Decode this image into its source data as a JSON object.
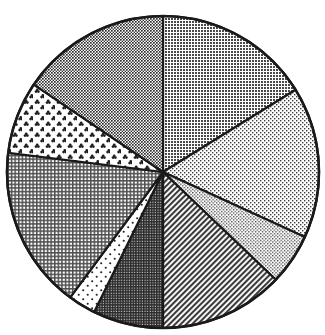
{
  "chart_data": {
    "type": "pie",
    "title": "",
    "subtitle": "",
    "xlabel": "",
    "ylabel": "",
    "legend_position": "none",
    "grid": false,
    "start_angle_deg": 0,
    "direction": "clockwise",
    "center_px": [
      163,
      172
    ],
    "radius_px": 156,
    "categories": [
      "Slice 1",
      "Slice 2",
      "Slice 3",
      "Slice 4",
      "Slice 5",
      "Slice 6",
      "Slice 7",
      "Slice 8",
      "Slice 9"
    ],
    "values": [
      58.2,
      56.4,
      19.1,
      46.3,
      26.2,
      10.3,
      60.6,
      27.0,
      55.9
    ],
    "percentages": [
      16.2,
      15.7,
      5.3,
      12.9,
      7.3,
      2.9,
      16.8,
      7.5,
      15.5
    ],
    "angles_deg": [
      58.2,
      56.4,
      19.1,
      46.3,
      26.2,
      10.3,
      60.6,
      27.0,
      55.9
    ],
    "boundaries_deg": [
      0,
      58.2,
      114.6,
      133.7,
      180.0,
      206.2,
      216.5,
      277.1,
      304.1,
      360
    ],
    "slices": [
      {
        "label": "Slice 1",
        "value": 58.2,
        "percent": 16.2,
        "start_deg": 0,
        "end_deg": 58.2,
        "pattern": "dense-dot-medium-gray",
        "fill_color": "#7d7d7d"
      },
      {
        "label": "Slice 2",
        "value": 56.4,
        "percent": 15.7,
        "start_deg": 58.2,
        "end_deg": 114.6,
        "pattern": "sparse-dot-light-gray",
        "fill_color": "#d2d2d2"
      },
      {
        "label": "Slice 3",
        "value": 19.1,
        "percent": 5.3,
        "start_deg": 114.6,
        "end_deg": 133.7,
        "pattern": "fine-dot-light-gray",
        "fill_color": "#c9c9c9"
      },
      {
        "label": "Slice 4",
        "value": 46.3,
        "percent": 12.9,
        "start_deg": 133.7,
        "end_deg": 180.0,
        "pattern": "diagonal-hatch-gray",
        "fill_color": "#9a9a9a"
      },
      {
        "label": "Slice 5",
        "value": 26.2,
        "percent": 7.3,
        "start_deg": 180.0,
        "end_deg": 206.2,
        "pattern": "dense-dot-dark-gray",
        "fill_color": "#555555"
      },
      {
        "label": "Slice 6",
        "value": 10.3,
        "percent": 2.9,
        "start_deg": 206.2,
        "end_deg": 216.5,
        "pattern": "very-sparse-dot-white",
        "fill_color": "#fbfbfb"
      },
      {
        "label": "Slice 7",
        "value": 60.6,
        "percent": 16.8,
        "start_deg": 216.5,
        "end_deg": 277.1,
        "pattern": "crosshatch-grid-gray",
        "fill_color": "#a6a6a6"
      },
      {
        "label": "Slice 8",
        "value": 27.0,
        "percent": 7.5,
        "start_deg": 277.1,
        "end_deg": 304.1,
        "pattern": "clover-dot-white",
        "fill_color": "#f7f7f7"
      },
      {
        "label": "Slice 9",
        "value": 55.9,
        "percent": 15.5,
        "start_deg": 304.1,
        "end_deg": 360,
        "pattern": "checker-dot-dark-gray",
        "fill_color": "#737373"
      }
    ],
    "stroke_color": "#1a1a1a",
    "background_color": "#ffffff"
  }
}
